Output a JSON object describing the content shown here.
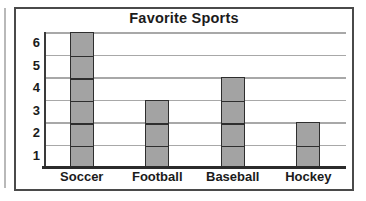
{
  "chart_data": {
    "type": "bar",
    "title": "Favorite Sports",
    "xlabel": "",
    "ylabel": "",
    "categories": [
      "Soccer",
      "Football",
      "Baseball",
      "Hockey"
    ],
    "values": [
      6,
      3,
      4,
      2
    ],
    "ytick_labels": [
      "6",
      "5",
      "4",
      "3",
      "2",
      "1"
    ],
    "ylim": [
      0,
      6
    ],
    "grid": true,
    "legend": false,
    "bar_color": "#a3a3a3",
    "bar_border_color": "#2e2e2e",
    "gridline_color": "#a8a8a8",
    "axis_color": "#2b2b2b",
    "frame_color": "#4a4a4a",
    "text_color": "#1b1b1b",
    "background": "#ffffff"
  }
}
